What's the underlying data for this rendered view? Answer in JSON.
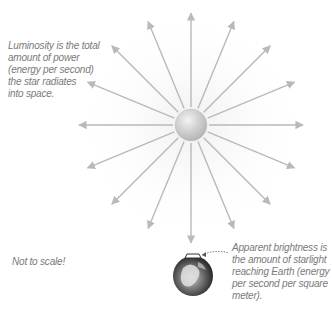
{
  "diagram": {
    "star": {
      "label": "star",
      "ray_count": 16
    },
    "earth": {
      "label": "Earth"
    },
    "captions": {
      "luminosity": "Luminosity is the total\namount of power\n(energy per second)\nthe star radiates\ninto space.",
      "apparent_brightness": "Apparent brightness is\nthe amount of starlight\nreaching Earth (energy\nper second per square\nmeter).",
      "scale_note": "Not to scale!"
    },
    "colors": {
      "ray": "#b9b9b9",
      "text": "#7a7a7a",
      "star_light": "#f2f2f2",
      "star_dark": "#b5b5b5",
      "earth_dark": "#1e1e1e",
      "earth_light": "#d8d8d8"
    }
  }
}
